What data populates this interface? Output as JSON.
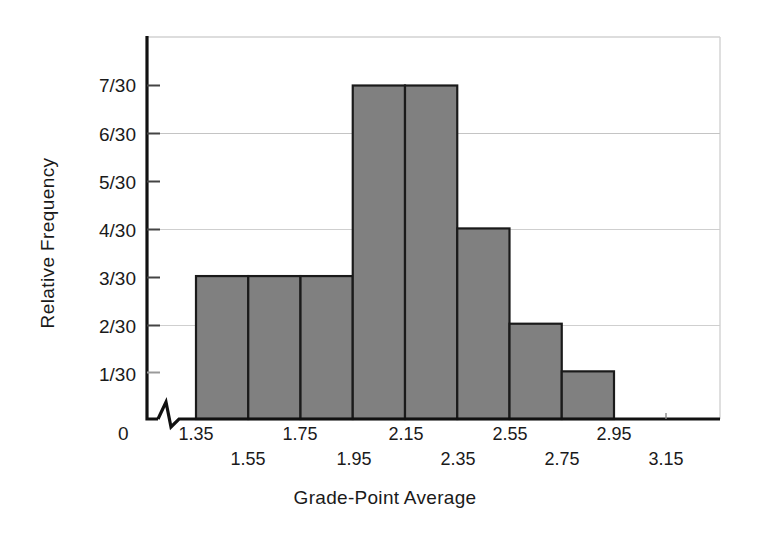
{
  "chart_data": {
    "type": "bar",
    "title": "",
    "subtitle": "",
    "xlabel": "Grade-Point Average",
    "ylabel": "Relative Frequency",
    "categories": [
      "1.35-1.55",
      "1.55-1.75",
      "1.75-1.95",
      "1.95-2.15",
      "2.15-2.35",
      "2.35-2.55",
      "2.55-2.75",
      "2.75-2.95"
    ],
    "bin_edges": [
      1.35,
      1.55,
      1.75,
      1.95,
      2.15,
      2.35,
      2.55,
      2.75,
      2.95
    ],
    "bin_width": 0.2,
    "values": [
      0.1,
      0.1,
      0.1,
      0.2333333,
      0.2333333,
      0.1333333,
      0.0666667,
      0.0333333
    ],
    "counts": [
      3,
      3,
      3,
      7,
      7,
      4,
      2,
      1
    ],
    "value_labels": [
      "3/30",
      "3/30",
      "3/30",
      "7/30",
      "7/30",
      "4/30",
      "2/30",
      "1/30"
    ],
    "sample_size": 30,
    "xtick_labels": [
      "1.35",
      "1.55",
      "1.75",
      "1.95",
      "2.15",
      "2.35",
      "2.55",
      "2.75",
      "2.95",
      "3.15"
    ],
    "xtick_values": [
      1.35,
      1.55,
      1.75,
      1.95,
      2.15,
      2.35,
      2.55,
      2.75,
      2.95,
      3.15
    ],
    "ytick_labels": [
      "7/30",
      "6/30",
      "5/30",
      "4/30",
      "3/30",
      "2/30",
      "1/30"
    ],
    "ytick_values": [
      0.2333333,
      0.2,
      0.1666667,
      0.1333333,
      0.1,
      0.0666667,
      0.0333333
    ],
    "y_origin_label": "0",
    "ylim": [
      0,
      0.2333333
    ],
    "xlim": [
      1.35,
      3.15
    ],
    "grid": true,
    "gridlines_at": [
      "2/30",
      "4/30",
      "6/30",
      "7/30"
    ],
    "legend": null,
    "legend_position": "none",
    "x_axis_break": true,
    "bar_fill_color": "#808080",
    "bar_edge_color": "#1a1a1a",
    "axis_color": "#111111",
    "grid_color": "#c8c8c8",
    "background_color": "#ffffff"
  }
}
